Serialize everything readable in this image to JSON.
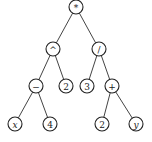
{
  "diagram": {
    "type": "expression-tree",
    "nodes": [
      {
        "id": "n1",
        "label": "*",
        "x": 76,
        "y": 7,
        "italic": false
      },
      {
        "id": "n2",
        "label": "^",
        "x": 53,
        "y": 49,
        "italic": false
      },
      {
        "id": "n3",
        "label": "/",
        "x": 99,
        "y": 49,
        "italic": false
      },
      {
        "id": "n4",
        "label": "−",
        "x": 36,
        "y": 86,
        "italic": false
      },
      {
        "id": "n5",
        "label": "2",
        "x": 66,
        "y": 86,
        "italic": false
      },
      {
        "id": "n6",
        "label": "3",
        "x": 87,
        "y": 86,
        "italic": false
      },
      {
        "id": "n7",
        "label": "+",
        "x": 112,
        "y": 86,
        "italic": false
      },
      {
        "id": "n8",
        "label": "x",
        "x": 15,
        "y": 124,
        "italic": true
      },
      {
        "id": "n9",
        "label": "4",
        "x": 50,
        "y": 124,
        "italic": false
      },
      {
        "id": "n10",
        "label": "2",
        "x": 102,
        "y": 124,
        "italic": false
      },
      {
        "id": "n11",
        "label": "y",
        "x": 136,
        "y": 124,
        "italic": true
      }
    ],
    "edges": [
      [
        "n1",
        "n2"
      ],
      [
        "n1",
        "n3"
      ],
      [
        "n2",
        "n4"
      ],
      [
        "n2",
        "n5"
      ],
      [
        "n3",
        "n6"
      ],
      [
        "n3",
        "n7"
      ],
      [
        "n4",
        "n8"
      ],
      [
        "n4",
        "n9"
      ],
      [
        "n7",
        "n10"
      ],
      [
        "n7",
        "n11"
      ]
    ],
    "node_radius": 7,
    "expression": "((x − 4) ^ 2) * (3 / (2 + y))"
  },
  "caption": ""
}
